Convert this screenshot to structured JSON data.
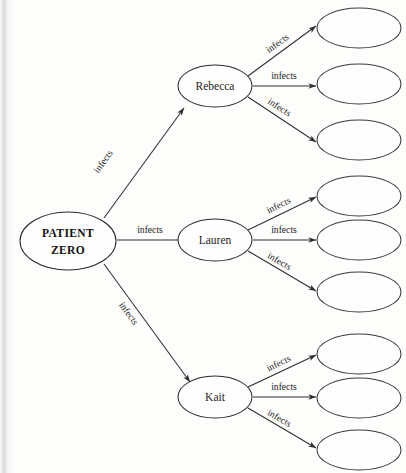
{
  "diagram": {
    "type": "infection-transmission-tree",
    "root": {
      "id": "patient-zero",
      "label_line1": "PATIENT",
      "label_line2": "ZERO"
    },
    "edge_label": "infects",
    "branches": [
      {
        "id": "rebecca",
        "label": "Rebecca",
        "leaves": [
          {
            "id": "rebecca-leaf-1",
            "label": ""
          },
          {
            "id": "rebecca-leaf-2",
            "label": ""
          },
          {
            "id": "rebecca-leaf-3",
            "label": ""
          }
        ],
        "leaf_edge_labels": [
          "infects",
          "infects",
          "infects"
        ],
        "root_edge_label": "infects"
      },
      {
        "id": "lauren",
        "label": "Lauren",
        "leaves": [
          {
            "id": "lauren-leaf-1",
            "label": ""
          },
          {
            "id": "lauren-leaf-2",
            "label": ""
          },
          {
            "id": "lauren-leaf-3",
            "label": ""
          }
        ],
        "leaf_edge_labels": [
          "infects",
          "infects",
          "infects"
        ],
        "root_edge_label": "infects"
      },
      {
        "id": "kait",
        "label": "Kait",
        "leaves": [
          {
            "id": "kait-leaf-1",
            "label": ""
          },
          {
            "id": "kait-leaf-2",
            "label": ""
          },
          {
            "id": "kait-leaf-3",
            "label": ""
          }
        ],
        "leaf_edge_labels": [
          "infects",
          "infects",
          "infects"
        ],
        "root_edge_label": "infects"
      }
    ],
    "colors": {
      "ink": "#2b2b2b",
      "text": "#1d1d1d",
      "paper": "#fdfdfc",
      "scan_edge": "#dcdcdc"
    }
  }
}
